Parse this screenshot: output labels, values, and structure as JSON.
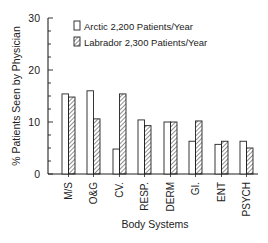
{
  "chart_data": {
    "type": "bar",
    "title": "",
    "xlabel": "Body Systems",
    "ylabel": "% Patients Seen by Physician",
    "ylim": [
      0,
      30
    ],
    "yticks": [
      0,
      10,
      20,
      30
    ],
    "grid": false,
    "legend_position": "top-right inside",
    "categories": [
      "M/S",
      "O&G",
      "CV.",
      "RESP.",
      "DERM",
      "GI.",
      "ENT",
      "PSYCH"
    ],
    "series": [
      {
        "name": "Arctic 2,200 Patients/Year",
        "pattern": "open",
        "values": [
          15.4,
          16.0,
          4.8,
          10.4,
          10.0,
          6.3,
          5.7,
          6.3
        ]
      },
      {
        "name": "Labrador 2,300 Patients/Year",
        "pattern": "hatched",
        "values": [
          14.8,
          10.6,
          15.4,
          9.3,
          10.0,
          10.2,
          6.3,
          5.0
        ]
      }
    ]
  },
  "legend": {
    "arctic": "Arctic 2,200 Patients/Year",
    "labrador": "Labrador 2,300 Patients/Year"
  },
  "axis": {
    "ylabel": "% Patients Seen by Physician",
    "xlabel": "Body Systems",
    "ytick_labels": [
      "0",
      "10",
      "20",
      "30"
    ]
  }
}
